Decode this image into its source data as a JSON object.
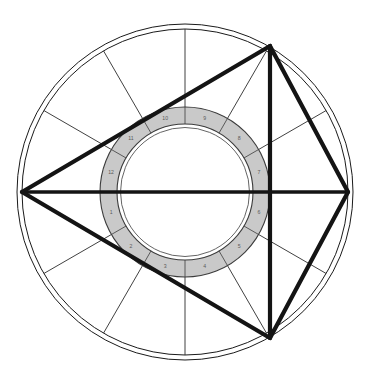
{
  "figure": {
    "kind": "astrological-chart-wheel",
    "width": 370,
    "height": 374,
    "background_color": "#ffffff"
  },
  "geometry": {
    "center_x": 185,
    "center_y": 192,
    "outer_circle_outer_radius": 168,
    "outer_circle_inner_radius": 163,
    "annulus_outer_radius": 85,
    "annulus_inner_radius": 68,
    "annulus_inner_hairline_radius": 64.5
  },
  "colors": {
    "line_dark": "#1a1a1a",
    "line_thin": "#2b2b2b",
    "annulus_fill": "#c9c9c9",
    "annulus_stroke": "#3c3c3c",
    "number_text": "#5a5a5a",
    "aspect_line": "#141414"
  },
  "strokes": {
    "outer_circle_width": 1.0,
    "spoke_width": 0.9,
    "annulus_border_width": 1.1,
    "annulus_divider_width": 0.8,
    "aspect_line_width": 4.2,
    "axis_line_width": 3.6,
    "thin_aspect_width": 0.9
  },
  "houses": {
    "count": 12,
    "label": "House numbers",
    "items": [
      {
        "number": "1",
        "angle_deg": 195
      },
      {
        "number": "2",
        "angle_deg": 225
      },
      {
        "number": "3",
        "angle_deg": 255
      },
      {
        "number": "4",
        "angle_deg": 285
      },
      {
        "number": "5",
        "angle_deg": 315
      },
      {
        "number": "6",
        "angle_deg": 345
      },
      {
        "number": "7",
        "angle_deg": 15
      },
      {
        "number": "8",
        "angle_deg": 45
      },
      {
        "number": "9",
        "angle_deg": 75
      },
      {
        "number": "10",
        "angle_deg": 105
      },
      {
        "number": "11",
        "angle_deg": 135
      },
      {
        "number": "12",
        "angle_deg": 165
      }
    ]
  },
  "cusps": {
    "label": "House cusp spokes",
    "angles_deg": [
      0,
      30,
      60,
      90,
      120,
      150,
      180,
      210,
      240,
      270,
      300,
      330
    ]
  },
  "annulus_dividers": {
    "label": "Annulus segment dividers",
    "angles_deg": [
      0,
      30,
      60,
      90,
      120,
      150,
      180,
      210,
      240,
      270,
      300,
      330
    ]
  },
  "aspects": {
    "label": "Aspect lines",
    "vertices": [
      {
        "id": "left",
        "x": 22,
        "y": 192
      },
      {
        "id": "top-right",
        "x": 270,
        "y": 46
      },
      {
        "id": "right",
        "x": 348,
        "y": 192
      },
      {
        "id": "bottom-right",
        "x": 270,
        "y": 338
      }
    ],
    "thick_lines": [
      {
        "from": "left",
        "to": "top-right"
      },
      {
        "from": "left",
        "to": "right"
      },
      {
        "from": "left",
        "to": "bottom-right"
      },
      {
        "from": "top-right",
        "to": "right"
      },
      {
        "from": "top-right",
        "to": "bottom-right"
      },
      {
        "from": "right",
        "to": "bottom-right"
      }
    ],
    "thin_lines": [
      {
        "from": "top-right",
        "to": "bottom-right"
      }
    ]
  }
}
